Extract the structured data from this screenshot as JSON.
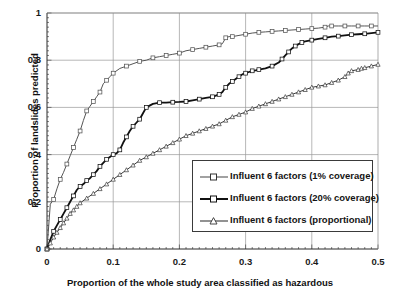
{
  "chart_data": {
    "type": "line",
    "title": "",
    "xlabel": "Proportion of the whole study area classified as hazardous",
    "ylabel": "Proportion of landslides predicted",
    "xlim": [
      0,
      0.5
    ],
    "ylim": [
      0,
      1
    ],
    "xticks": [
      "0",
      "0.1",
      "0.2",
      "0.3",
      "0.4",
      "0.5"
    ],
    "xtick_values": [
      0,
      0.1,
      0.2,
      0.3,
      0.4,
      0.5
    ],
    "yticks": [
      "0",
      "0.2",
      "0.4",
      "0.6",
      "0.8",
      "1"
    ],
    "ytick_values": [
      0,
      0.2,
      0.4,
      0.6,
      0.8,
      1
    ],
    "grid": true,
    "grid_color": "#9a9a9a",
    "legend_position": "center-right",
    "series": [
      {
        "name": "Influent 6 factors (1% coverage)",
        "marker": "open-square",
        "color": "#555555",
        "line_width": 1,
        "x": [
          0,
          0.005,
          0.01,
          0.015,
          0.02,
          0.025,
          0.03,
          0.035,
          0.04,
          0.045,
          0.05,
          0.055,
          0.06,
          0.065,
          0.07,
          0.075,
          0.08,
          0.085,
          0.09,
          0.095,
          0.1,
          0.11,
          0.12,
          0.13,
          0.14,
          0.15,
          0.16,
          0.17,
          0.18,
          0.19,
          0.2,
          0.21,
          0.22,
          0.23,
          0.24,
          0.25,
          0.26,
          0.265,
          0.27,
          0.275,
          0.28,
          0.29,
          0.3,
          0.31,
          0.32,
          0.33,
          0.34,
          0.35,
          0.36,
          0.37,
          0.38,
          0.39,
          0.4,
          0.41,
          0.42,
          0.425,
          0.43,
          0.44,
          0.45,
          0.46,
          0.47,
          0.48,
          0.49,
          0.5
        ],
        "y": [
          0,
          0.19,
          0.21,
          0.255,
          0.295,
          0.325,
          0.36,
          0.395,
          0.43,
          0.465,
          0.5,
          0.545,
          0.585,
          0.605,
          0.625,
          0.645,
          0.665,
          0.7,
          0.715,
          0.73,
          0.745,
          0.765,
          0.775,
          0.785,
          0.795,
          0.8,
          0.81,
          0.815,
          0.82,
          0.825,
          0.83,
          0.84,
          0.845,
          0.85,
          0.855,
          0.86,
          0.865,
          0.87,
          0.895,
          0.9,
          0.9,
          0.905,
          0.91,
          0.915,
          0.918,
          0.92,
          0.922,
          0.924,
          0.926,
          0.928,
          0.93,
          0.932,
          0.934,
          0.936,
          0.94,
          0.945,
          0.945,
          0.945,
          0.945,
          0.945,
          0.945,
          0.945,
          0.945,
          0.945
        ]
      },
      {
        "name": "Influent 6 factors (20% coverage)",
        "marker": "open-square",
        "color": "#111111",
        "line_width": 1.8,
        "x": [
          0,
          0.005,
          0.01,
          0.015,
          0.02,
          0.025,
          0.03,
          0.035,
          0.04,
          0.045,
          0.05,
          0.055,
          0.06,
          0.065,
          0.07,
          0.075,
          0.08,
          0.085,
          0.09,
          0.095,
          0.1,
          0.105,
          0.11,
          0.115,
          0.12,
          0.125,
          0.13,
          0.135,
          0.14,
          0.145,
          0.15,
          0.16,
          0.17,
          0.18,
          0.19,
          0.2,
          0.21,
          0.22,
          0.23,
          0.24,
          0.25,
          0.255,
          0.26,
          0.265,
          0.27,
          0.275,
          0.28,
          0.285,
          0.29,
          0.295,
          0.3,
          0.305,
          0.31,
          0.315,
          0.32,
          0.33,
          0.34,
          0.35,
          0.355,
          0.36,
          0.365,
          0.37,
          0.375,
          0.38,
          0.385,
          0.39,
          0.4,
          0.41,
          0.42,
          0.43,
          0.44,
          0.45,
          0.46,
          0.47,
          0.48,
          0.49,
          0.5
        ],
        "y": [
          0,
          0.04,
          0.075,
          0.1,
          0.125,
          0.15,
          0.175,
          0.2,
          0.225,
          0.25,
          0.265,
          0.275,
          0.29,
          0.3,
          0.315,
          0.33,
          0.35,
          0.365,
          0.38,
          0.39,
          0.4,
          0.405,
          0.42,
          0.45,
          0.475,
          0.5,
          0.52,
          0.535,
          0.55,
          0.575,
          0.6,
          0.615,
          0.62,
          0.62,
          0.622,
          0.623,
          0.625,
          0.63,
          0.635,
          0.64,
          0.645,
          0.65,
          0.655,
          0.665,
          0.685,
          0.7,
          0.71,
          0.72,
          0.73,
          0.74,
          0.745,
          0.75,
          0.755,
          0.757,
          0.76,
          0.765,
          0.775,
          0.79,
          0.805,
          0.82,
          0.835,
          0.85,
          0.86,
          0.868,
          0.875,
          0.88,
          0.885,
          0.89,
          0.895,
          0.9,
          0.902,
          0.905,
          0.908,
          0.91,
          0.912,
          0.915,
          0.918
        ]
      },
      {
        "name": "Influent 6 factors (proportional)",
        "marker": "open-triangle",
        "color": "#3a3a3a",
        "line_width": 1,
        "x": [
          0,
          0.005,
          0.01,
          0.015,
          0.02,
          0.025,
          0.03,
          0.035,
          0.04,
          0.045,
          0.05,
          0.06,
          0.07,
          0.08,
          0.09,
          0.1,
          0.11,
          0.12,
          0.13,
          0.14,
          0.15,
          0.16,
          0.17,
          0.18,
          0.19,
          0.2,
          0.21,
          0.22,
          0.23,
          0.24,
          0.25,
          0.26,
          0.27,
          0.28,
          0.29,
          0.3,
          0.31,
          0.32,
          0.33,
          0.34,
          0.35,
          0.36,
          0.37,
          0.38,
          0.39,
          0.4,
          0.41,
          0.42,
          0.43,
          0.44,
          0.45,
          0.455,
          0.46,
          0.47,
          0.475,
          0.48,
          0.49,
          0.5
        ],
        "y": [
          0,
          0.025,
          0.05,
          0.07,
          0.09,
          0.11,
          0.13,
          0.15,
          0.165,
          0.18,
          0.195,
          0.215,
          0.235,
          0.255,
          0.275,
          0.295,
          0.315,
          0.335,
          0.355,
          0.375,
          0.39,
          0.405,
          0.42,
          0.435,
          0.45,
          0.465,
          0.48,
          0.49,
          0.5,
          0.51,
          0.52,
          0.53,
          0.545,
          0.56,
          0.57,
          0.58,
          0.595,
          0.605,
          0.615,
          0.625,
          0.635,
          0.645,
          0.655,
          0.665,
          0.675,
          0.685,
          0.69,
          0.695,
          0.705,
          0.715,
          0.73,
          0.745,
          0.755,
          0.76,
          0.765,
          0.768,
          0.775,
          0.782
        ]
      }
    ]
  },
  "axes": {
    "x_title": "Proportion of the whole study area classified as hazardous",
    "y_title": "Proportion of landslides predicted",
    "x_labels": [
      "0",
      "0.1",
      "0.2",
      "0.3",
      "0.4",
      "0.5"
    ],
    "y_labels": [
      "0",
      "0.2",
      "0.4",
      "0.6",
      "0.8",
      "1"
    ]
  },
  "legend": {
    "entries": [
      {
        "label": "Influent 6 factors (1% coverage)",
        "marker": "open-square",
        "color": "#555555"
      },
      {
        "label": "Influent 6 factors (20% coverage)",
        "marker": "open-square",
        "color": "#111111"
      },
      {
        "label": "Influent 6 factors (proportional)",
        "marker": "open-triangle",
        "color": "#3a3a3a"
      }
    ]
  }
}
